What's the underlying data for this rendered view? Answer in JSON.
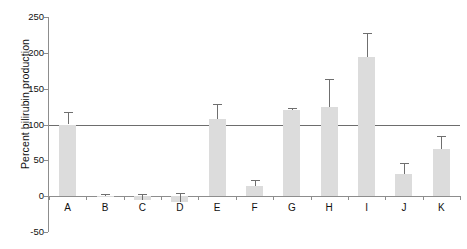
{
  "chart_data": {
    "type": "bar",
    "title": "",
    "subtitle": "",
    "xlabel": "",
    "ylabel": "Percent bilirubin production",
    "categories": [
      "A",
      "B",
      "C",
      "D",
      "E",
      "F",
      "G",
      "H",
      "I",
      "J",
      "K"
    ],
    "values": [
      100,
      0,
      -5,
      -8,
      107,
      14,
      120,
      124,
      194,
      31,
      66
    ],
    "errors": [
      17,
      3,
      8,
      12,
      21,
      8,
      3,
      40,
      33,
      15,
      18
    ],
    "ylim": [
      -50,
      250
    ],
    "yticks": [
      -50,
      0,
      50,
      100,
      150,
      200,
      250
    ],
    "ytick_labels": [
      "-50",
      "0",
      "50",
      "100",
      "150",
      "200",
      "250"
    ],
    "grid": false,
    "legend": null,
    "reference_line": {
      "value": 100,
      "label": "",
      "orientation": "horizontal"
    },
    "bar_color": "#dcdcdc",
    "error_color": "#6f6f6f",
    "axis_color": "#8d8d8d",
    "reference_line_color": "#6d6d6d",
    "error_bar_direction": "both"
  }
}
